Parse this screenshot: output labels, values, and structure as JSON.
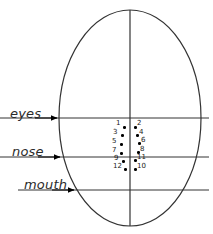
{
  "diagram": {
    "head_outline": {
      "shape": "ellipse",
      "cx": 130,
      "cy": 118,
      "rx": 71,
      "ry": 108,
      "stroke_color": "#333333"
    },
    "midline": {
      "label": "vertical-midline",
      "x": 130,
      "y1": 10,
      "y2": 226,
      "stroke_color": "#333333"
    },
    "reference_lines": [
      {
        "name": "eyes",
        "label": "eyes",
        "y": 118,
        "x_start": 0,
        "x_end": 209,
        "arrow_tip_x": 57,
        "label_x": 10,
        "label_y": 106
      },
      {
        "name": "nose",
        "label": "nose",
        "y": 157,
        "x_start": 0,
        "x_end": 209,
        "arrow_tip_x": 60,
        "label_x": 12,
        "label_y": 144
      },
      {
        "name": "mouth",
        "label": "mouth",
        "y": 190,
        "x_start": 18,
        "x_end": 209,
        "arrow_tip_x": 74,
        "label_x": 24,
        "label_y": 177
      }
    ],
    "landmark_points": [
      {
        "id": "1",
        "dot_x": 123,
        "dot_y": 126,
        "num_x": 116,
        "num_y": 120,
        "side": "left"
      },
      {
        "id": "2",
        "dot_x": 134,
        "dot_y": 126,
        "num_x": 137,
        "num_y": 120,
        "side": "right"
      },
      {
        "id": "3",
        "dot_x": 121,
        "dot_y": 134,
        "num_x": 113,
        "num_y": 129,
        "side": "left"
      },
      {
        "id": "4",
        "dot_x": 136,
        "dot_y": 134,
        "num_x": 139,
        "num_y": 129,
        "side": "right"
      },
      {
        "id": "5",
        "dot_x": 120,
        "dot_y": 143,
        "num_x": 112,
        "num_y": 138,
        "side": "left"
      },
      {
        "id": "6",
        "dot_x": 138,
        "dot_y": 142,
        "num_x": 141,
        "num_y": 137,
        "side": "right"
      },
      {
        "id": "7",
        "dot_x": 120,
        "dot_y": 152,
        "num_x": 112,
        "num_y": 147,
        "side": "left"
      },
      {
        "id": "8",
        "dot_x": 137,
        "dot_y": 151,
        "num_x": 140,
        "num_y": 146,
        "side": "right"
      },
      {
        "id": "9",
        "dot_x": 122,
        "dot_y": 160,
        "num_x": 114,
        "num_y": 155,
        "side": "left"
      },
      {
        "id": "10",
        "dot_x": 134,
        "dot_y": 168,
        "num_x": 137,
        "num_y": 163,
        "side": "right"
      },
      {
        "id": "11",
        "dot_x": 134,
        "dot_y": 159,
        "num_x": 137,
        "num_y": 154,
        "side": "right"
      },
      {
        "id": "12",
        "dot_x": 124,
        "dot_y": 168,
        "num_x": 113,
        "num_y": 163,
        "side": "left"
      }
    ]
  }
}
